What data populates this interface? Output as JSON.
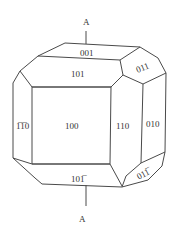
{
  "diagram": {
    "title": "",
    "axis": {
      "top_label": "A",
      "bottom_label": "A"
    },
    "faces": {
      "f001": "001",
      "f101": "101",
      "f011": "011",
      "f100": "100",
      "f110": "110",
      "f010": "010",
      "f1b10": "1̅0",
      "f10b1": "101̅",
      "f01b1": "011̅"
    },
    "face_list": [
      {
        "id": "001",
        "label": "001"
      },
      {
        "id": "101",
        "label": "101"
      },
      {
        "id": "011",
        "label": "011"
      },
      {
        "id": "100",
        "label": "100"
      },
      {
        "id": "110",
        "label": "110"
      },
      {
        "id": "010",
        "label": "010"
      },
      {
        "id": "1-10",
        "label": "1̅1̅0"
      },
      {
        "id": "10-1",
        "label": "101̅"
      },
      {
        "id": "01-1",
        "label": "011̅"
      }
    ]
  }
}
